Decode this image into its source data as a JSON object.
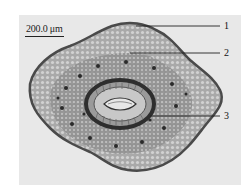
{
  "figure": {
    "scale_bar": {
      "label": "200.0 μm"
    },
    "callouts": [
      {
        "number": "1"
      },
      {
        "number": "2"
      },
      {
        "number": "3"
      }
    ],
    "colors": {
      "background": "#e8e8e8",
      "tissue_outer": "#8a8a8a",
      "tissue_inner": "#b5b5b5",
      "vascular_ring": "#3a3a3a",
      "line": "#222222"
    }
  }
}
